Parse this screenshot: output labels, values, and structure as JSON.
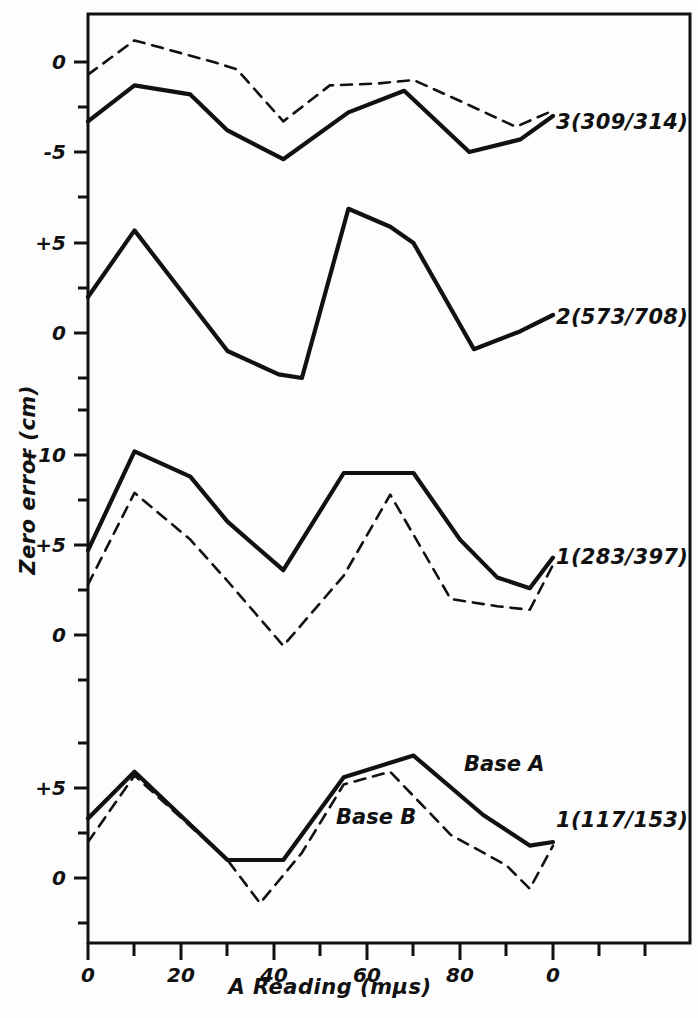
{
  "chart_data": {
    "type": "line",
    "title": "",
    "xlabel": "A   Reading  (mµs)",
    "ylabel": "Zero error (cm)",
    "grid": false,
    "legend_position": "inline-right",
    "xlim": [
      0,
      130
    ],
    "x_tick_labels": [
      "0",
      "20",
      "40",
      "60",
      "80",
      "0"
    ],
    "x_tick_values": [
      0,
      20,
      40,
      60,
      80,
      100
    ],
    "x_minor_tick_values": [
      10,
      30,
      50,
      70,
      90,
      110,
      120
    ],
    "panels": [
      {
        "name": "panel-3",
        "label": "3(309/314)",
        "y_tick_labels": [
          "0",
          "-5"
        ],
        "y_tick_values": [
          0,
          -5
        ],
        "series": [
          {
            "name": "Base A",
            "style": "solid",
            "x": [
              0,
              10,
              22,
              30,
              42,
              56,
              68,
              82,
              93,
              100
            ],
            "values": [
              -3.3,
              -1.3,
              -1.8,
              -3.8,
              -5.4,
              -2.8,
              -1.6,
              -5.0,
              -4.3,
              -3.0
            ]
          },
          {
            "name": "Base B",
            "style": "dashed",
            "x": [
              0,
              10,
              27,
              32,
              42,
              52,
              62,
              70,
              82,
              92,
              100
            ],
            "values": [
              -0.7,
              1.2,
              0.0,
              -0.4,
              -3.3,
              -1.3,
              -1.2,
              -1.0,
              -2.4,
              -3.6,
              -2.7
            ]
          }
        ]
      },
      {
        "name": "panel-2",
        "label": "2(573/708)",
        "y_tick_labels": [
          "+5",
          "0"
        ],
        "y_tick_values": [
          5,
          0
        ],
        "series": [
          {
            "name": "Base A",
            "style": "solid",
            "x": [
              0,
              10,
              30,
              41,
              46,
              56,
              65,
              70,
              83,
              93,
              100
            ],
            "values": [
              2.0,
              5.7,
              -1.0,
              -2.3,
              -2.5,
              6.9,
              5.9,
              5.0,
              -0.9,
              0.1,
              1.0
            ]
          }
        ]
      },
      {
        "name": "panel-1a",
        "label": "1(283/397)",
        "y_tick_labels": [
          "+10",
          "+5",
          "0"
        ],
        "y_tick_values": [
          10,
          5,
          0
        ],
        "series": [
          {
            "name": "Base A",
            "style": "solid",
            "x": [
              0,
              10,
              22,
              30,
              42,
              55,
              65,
              70,
              80,
              88,
              95,
              100
            ],
            "values": [
              4.7,
              10.2,
              8.8,
              6.3,
              3.6,
              9.0,
              9.0,
              9.0,
              5.3,
              3.2,
              2.6,
              4.3
            ]
          },
          {
            "name": "Base B",
            "style": "dashed",
            "x": [
              0,
              10,
              22,
              30,
              42,
              55,
              65,
              78,
              88,
              95,
              100
            ],
            "values": [
              2.8,
              7.9,
              5.3,
              3.0,
              -0.6,
              3.3,
              7.8,
              2.0,
              1.6,
              1.4,
              3.9
            ]
          }
        ]
      },
      {
        "name": "panel-1b",
        "label": "1(117/153)",
        "y_tick_labels": [
          "+5",
          "0"
        ],
        "y_tick_values": [
          5,
          0
        ],
        "series": [
          {
            "name": "Base A",
            "style": "solid",
            "x": [
              0,
              10,
              30,
              42,
              55,
              65,
              70,
              85,
              95,
              100
            ],
            "values": [
              3.3,
              5.9,
              1.0,
              1.0,
              5.6,
              6.4,
              6.8,
              3.5,
              1.8,
              2.0
            ]
          },
          {
            "name": "Base B",
            "style": "dashed",
            "x": [
              0,
              10,
              30,
              37,
              46,
              55,
              65,
              78,
              90,
              95,
              100
            ],
            "values": [
              2.0,
              5.7,
              1.0,
              -1.4,
              1.4,
              5.2,
              5.9,
              2.4,
              0.7,
              -0.6,
              1.8
            ]
          }
        ]
      }
    ],
    "annotations": [
      {
        "text": "Base A",
        "panel": "panel-1b"
      },
      {
        "text": "Base B",
        "panel": "panel-1b"
      }
    ]
  },
  "axis": {
    "x_title": "A   Reading  (mµs)",
    "y_title": "Zero error (cm)"
  },
  "ylabels": {
    "t1": "0",
    "t2": "-5",
    "t3": "+5",
    "t4": "0",
    "t5": "+10",
    "t6": "+5",
    "t7": "0",
    "t8": "+5",
    "t9": "0"
  },
  "xlabels": {
    "t1": "0",
    "t2": "20",
    "t3": "40",
    "t4": "60",
    "t5": "80",
    "t6": "0"
  },
  "series_labels": {
    "s3": "3(309/314)",
    "s2": "2(573/708)",
    "s1a": "1(283/397)",
    "s1b": "1(117/153)",
    "base_a": "Base A",
    "base_b": "Base B"
  },
  "colors": {
    "line": "#111111",
    "frame": "#111111",
    "background": "#fdfdfd"
  }
}
